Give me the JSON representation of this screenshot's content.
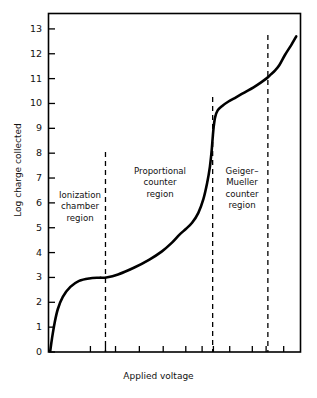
{
  "chart_data": {
    "type": "line",
    "title": "",
    "xlabel": "Applied voltage",
    "ylabel": "Log charge collected",
    "ylim": [
      0,
      13.6
    ],
    "xlim": [
      0,
      1
    ],
    "grid": false,
    "legend": "none",
    "y_ticks": [
      0,
      1,
      2,
      3,
      4,
      5,
      6,
      7,
      8,
      9,
      10,
      11,
      12,
      13
    ],
    "y_tick_labels": [
      "0",
      "1",
      "2",
      "3",
      "4",
      "5",
      "6",
      "7",
      "8",
      "9",
      "10",
      "11",
      "12",
      "13"
    ],
    "x_tick_labels": [],
    "x_ticks_fraction": [
      0.165,
      0.225,
      0.265,
      0.36,
      0.455,
      0.545,
      0.61,
      0.655,
      0.72,
      0.81,
      0.865,
      0.935
    ],
    "series": [
      {
        "name": "charge collected vs applied voltage",
        "x": [
          0.005,
          0.012,
          0.022,
          0.035,
          0.055,
          0.085,
          0.12,
          0.16,
          0.2,
          0.228,
          0.275,
          0.34,
          0.4,
          0.45,
          0.49,
          0.52,
          0.545,
          0.57,
          0.595,
          0.615,
          0.63,
          0.641,
          0.648,
          0.652,
          0.656,
          0.662,
          0.672,
          0.69,
          0.715,
          0.745,
          0.78,
          0.815,
          0.845,
          0.868,
          0.885,
          0.9,
          0.918,
          0.94,
          0.965,
          0.985
        ],
        "y": [
          0.05,
          0.55,
          1.15,
          1.72,
          2.22,
          2.62,
          2.86,
          2.96,
          2.99,
          3.0,
          3.12,
          3.4,
          3.72,
          4.05,
          4.4,
          4.72,
          4.95,
          5.2,
          5.6,
          6.15,
          6.8,
          7.45,
          8.1,
          8.6,
          9.05,
          9.45,
          9.72,
          9.9,
          10.08,
          10.25,
          10.45,
          10.65,
          10.85,
          11.02,
          11.18,
          11.32,
          11.55,
          11.95,
          12.35,
          12.7
        ]
      }
    ],
    "region_dividers_fraction": [
      0.225,
      0.652,
      0.872
    ],
    "regions": [
      {
        "name": "ionization-chamber-region",
        "label": "Ionization\nchamber\nregion"
      },
      {
        "name": "proportional-counter-region",
        "label": "Proportional\ncounter\nregion"
      },
      {
        "name": "geiger-mueller-counter-region",
        "label": "Geiger–\nMueller\ncounter\nregion"
      }
    ],
    "colors": {
      "curve": "#000000",
      "axis": "#000000",
      "divider": "#000000",
      "background": "#ffffff",
      "text": "#111111"
    }
  }
}
